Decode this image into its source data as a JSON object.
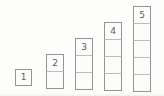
{
  "figure": {
    "columns": [
      {
        "label": "1",
        "count": 1
      },
      {
        "label": "2",
        "count": 2
      },
      {
        "label": "3",
        "count": 3
      },
      {
        "label": "4",
        "count": 4
      },
      {
        "label": "5",
        "count": 5
      }
    ],
    "colors": {
      "square_border": "#949494",
      "inner_divider": "#bcbcbc",
      "square_fill": "#fcfcfa",
      "label_text": "#5c5c5c",
      "background": "#fdfdfb"
    }
  }
}
